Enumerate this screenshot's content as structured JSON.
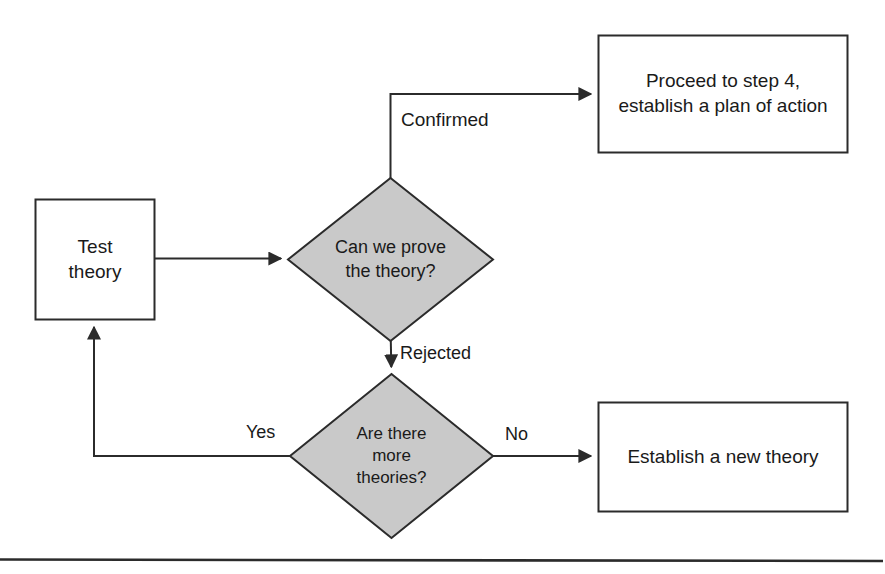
{
  "figure": {
    "kind": "flowchart",
    "background_color": "#ffffff",
    "stroke_color": "#2b2b2b",
    "node_fill_process": "#ffffff",
    "node_fill_decision": "#c9c9c9",
    "text_color": "#1a1a1a",
    "rule_color": "#2b2b2b"
  },
  "nodes": {
    "test_theory": {
      "shape": "process",
      "lines": [
        "Test",
        "theory"
      ]
    },
    "can_we_prove": {
      "shape": "decision",
      "lines": [
        "Can we prove",
        "the theory?"
      ]
    },
    "are_there_more": {
      "shape": "decision",
      "lines": [
        "Are there",
        "more",
        "theories?"
      ]
    },
    "proceed_step4": {
      "shape": "process",
      "lines": [
        "Proceed to step 4,",
        "establish a plan of action"
      ]
    },
    "establish_new_theory": {
      "shape": "process",
      "lines": [
        "Establish a new theory"
      ]
    }
  },
  "edges": {
    "test_to_decision": {
      "label": ""
    },
    "confirmed": {
      "label": "Confirmed"
    },
    "rejected": {
      "label": "Rejected"
    },
    "yes": {
      "label": "Yes"
    },
    "no": {
      "label": "No"
    }
  },
  "caption": {
    "text": ""
  }
}
